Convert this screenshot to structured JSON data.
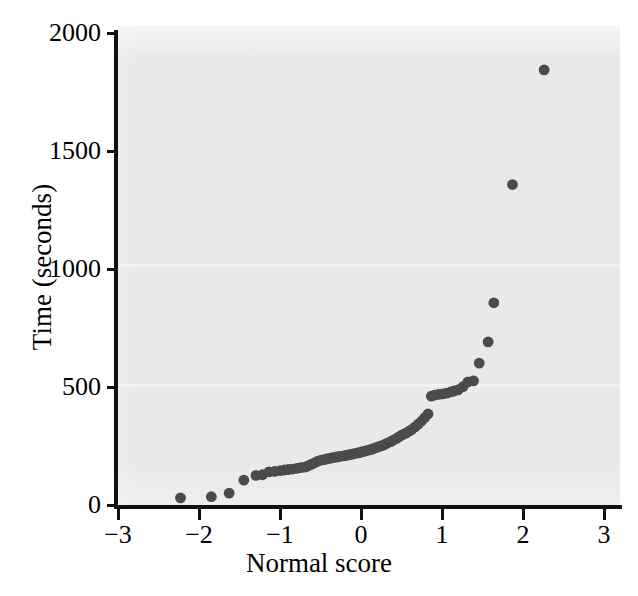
{
  "figure": {
    "background_color": "#ffffff",
    "panel_color": "#e9e9e9",
    "marker_color": "#4b4b4b",
    "axis_color": "#111111"
  },
  "axes": {
    "x_title": "Normal score",
    "y_title": "Time (seconds)",
    "x_ticks": [
      "−3",
      "−2",
      "−1",
      "0",
      "1",
      "2",
      "3"
    ],
    "y_ticks": [
      "0",
      "500",
      "1000",
      "1500",
      "2000"
    ]
  },
  "chart_data": {
    "type": "scatter",
    "title": "",
    "xlabel": "Normal score",
    "ylabel": "Time (seconds)",
    "xlim": [
      -3,
      3
    ],
    "ylim": [
      0,
      2000
    ],
    "xticks": [
      -3,
      -2,
      -1,
      0,
      1,
      2,
      3
    ],
    "yticks": [
      0,
      500,
      1000,
      1500,
      2000
    ],
    "grid": false,
    "legend": false,
    "marker": "filled-circle",
    "marker_color": "#4b4b4b",
    "series": [
      {
        "name": "Time vs normal score",
        "points": [
          [
            -2.23,
            30
          ],
          [
            -1.85,
            35
          ],
          [
            -1.63,
            50
          ],
          [
            -1.45,
            105
          ],
          [
            -1.3,
            125
          ],
          [
            -1.22,
            128
          ],
          [
            -1.14,
            140
          ],
          [
            -1.07,
            142
          ],
          [
            -1.0,
            145
          ],
          [
            -0.95,
            148
          ],
          [
            -0.9,
            150
          ],
          [
            -0.85,
            152
          ],
          [
            -0.8,
            155
          ],
          [
            -0.75,
            158
          ],
          [
            -0.7,
            160
          ],
          [
            -0.66,
            165
          ],
          [
            -0.62,
            172
          ],
          [
            -0.58,
            178
          ],
          [
            -0.54,
            185
          ],
          [
            -0.5,
            190
          ],
          [
            -0.46,
            192
          ],
          [
            -0.43,
            195
          ],
          [
            -0.39,
            197
          ],
          [
            -0.36,
            200
          ],
          [
            -0.32,
            202
          ],
          [
            -0.29,
            204
          ],
          [
            -0.26,
            206
          ],
          [
            -0.22,
            208
          ],
          [
            -0.19,
            210
          ],
          [
            -0.16,
            212
          ],
          [
            -0.13,
            214
          ],
          [
            -0.1,
            216
          ],
          [
            -0.06,
            219
          ],
          [
            -0.03,
            221
          ],
          [
            0.0,
            224
          ],
          [
            0.03,
            227
          ],
          [
            0.06,
            230
          ],
          [
            0.1,
            233
          ],
          [
            0.13,
            236
          ],
          [
            0.16,
            240
          ],
          [
            0.19,
            244
          ],
          [
            0.22,
            248
          ],
          [
            0.26,
            252
          ],
          [
            0.29,
            257
          ],
          [
            0.32,
            262
          ],
          [
            0.36,
            268
          ],
          [
            0.39,
            274
          ],
          [
            0.43,
            281
          ],
          [
            0.46,
            288
          ],
          [
            0.5,
            296
          ],
          [
            0.54,
            303
          ],
          [
            0.58,
            311
          ],
          [
            0.62,
            320
          ],
          [
            0.66,
            330
          ],
          [
            0.7,
            342
          ],
          [
            0.74,
            355
          ],
          [
            0.78,
            370
          ],
          [
            0.82,
            385
          ],
          [
            0.86,
            460
          ],
          [
            0.9,
            465
          ],
          [
            0.95,
            468
          ],
          [
            1.0,
            470
          ],
          [
            1.05,
            473
          ],
          [
            1.1,
            478
          ],
          [
            1.14,
            482
          ],
          [
            1.19,
            487
          ],
          [
            1.25,
            500
          ],
          [
            1.31,
            520
          ],
          [
            1.38,
            525
          ],
          [
            1.45,
            600
          ],
          [
            1.56,
            690
          ],
          [
            1.63,
            855
          ],
          [
            1.86,
            1355
          ],
          [
            2.25,
            1840
          ]
        ]
      }
    ]
  }
}
